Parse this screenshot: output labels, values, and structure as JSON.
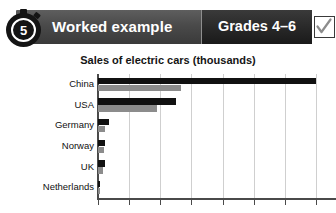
{
  "header": {
    "step_number": "5",
    "stopwatch_icon": "stopwatch-icon",
    "title": "Worked example",
    "grades_label": "Grades 4–6",
    "checkbox_icon": "check-icon",
    "colors": {
      "band": "#4a4a4a",
      "badge": "#262626",
      "text": "#ffffff",
      "checkbox_border": "#3a3a3a",
      "check_mark": "#8c8c8c"
    }
  },
  "chart_data": {
    "type": "bar",
    "orientation": "horizontal",
    "title": "Sales of electric cars (thousands)",
    "xlabel": "",
    "ylabel": "",
    "grid": true,
    "legend": "none",
    "categories": [
      "China",
      "USA",
      "Germany",
      "Norway",
      "UK",
      "Netherlands"
    ],
    "xlim": [
      0,
      700
    ],
    "xticks": [
      0,
      100,
      200,
      300,
      400,
      500,
      600,
      700
    ],
    "series": [
      {
        "name": "Series 1",
        "color": "#111111",
        "values": [
          700,
          250,
          36,
          24,
          24,
          6
        ]
      },
      {
        "name": "Series 2",
        "color": "#8c8c8c",
        "values": [
          265,
          190,
          24,
          20,
          16,
          3
        ]
      }
    ]
  }
}
